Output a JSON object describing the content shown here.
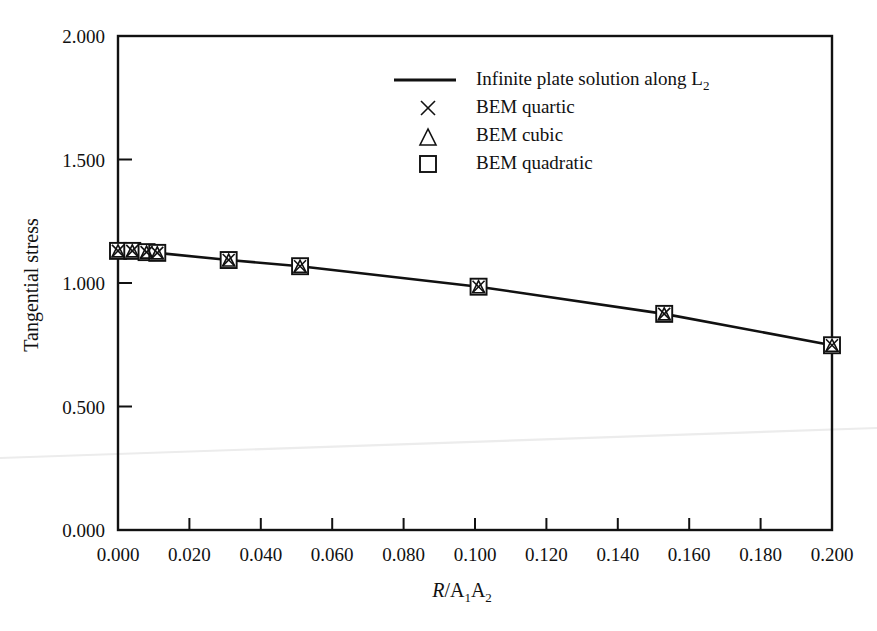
{
  "chart_data": {
    "type": "line",
    "title": "",
    "xlabel": "R/A1A2",
    "xlabel_parts": {
      "italic": "R",
      "slash": "/",
      "a1": "A",
      "sub1": "1",
      "a2": "A",
      "sub2": "2"
    },
    "ylabel": "Tangential stress",
    "xlim": [
      0.0,
      0.2
    ],
    "ylim": [
      0.0,
      2.0
    ],
    "xticks": [
      "0.000",
      "0.020",
      "0.040",
      "0.060",
      "0.080",
      "0.100",
      "0.120",
      "0.140",
      "0.160",
      "0.180",
      "0.200"
    ],
    "xtick_values": [
      0.0,
      0.02,
      0.04,
      0.06,
      0.08,
      0.1,
      0.12,
      0.14,
      0.16,
      0.18,
      0.2
    ],
    "yticks": [
      "0.000",
      "0.500",
      "1.000",
      "1.500",
      "2.000"
    ],
    "ytick_values": [
      0.0,
      0.5,
      1.0,
      1.5,
      2.0
    ],
    "grid": false,
    "legend_position": "top-center",
    "series": [
      {
        "name": "Infinite plate solution along L2",
        "marker": "line",
        "x": [
          0.0,
          0.004,
          0.008,
          0.011,
          0.031,
          0.051,
          0.101,
          0.153,
          0.2
        ],
        "values": [
          1.13,
          1.13,
          1.125,
          1.122,
          1.093,
          1.068,
          0.985,
          0.875,
          0.748
        ]
      },
      {
        "name": "BEM quartic",
        "marker": "cross",
        "x": [
          0.0,
          0.004,
          0.008,
          0.011,
          0.031,
          0.051,
          0.101,
          0.153,
          0.2
        ],
        "values": [
          1.13,
          1.13,
          1.125,
          1.122,
          1.093,
          1.068,
          0.985,
          0.875,
          0.748
        ]
      },
      {
        "name": "BEM cubic",
        "marker": "triangle",
        "x": [
          0.0,
          0.004,
          0.008,
          0.011,
          0.031,
          0.051,
          0.101,
          0.153,
          0.2
        ],
        "values": [
          1.13,
          1.13,
          1.125,
          1.122,
          1.093,
          1.068,
          0.985,
          0.875,
          0.748
        ]
      },
      {
        "name": "BEM quadratic",
        "marker": "square",
        "x": [
          0.0,
          0.004,
          0.008,
          0.011,
          0.031,
          0.051,
          0.101,
          0.153,
          0.2
        ],
        "values": [
          1.13,
          1.13,
          1.125,
          1.122,
          1.093,
          1.068,
          0.985,
          0.875,
          0.748
        ]
      }
    ],
    "legend": [
      {
        "label_prefix": "Infinite plate solution along L",
        "label_sub": "2",
        "marker": "line"
      },
      {
        "label_prefix": "BEM quartic",
        "label_sub": "",
        "marker": "cross"
      },
      {
        "label_prefix": "BEM cubic",
        "label_sub": "",
        "marker": "triangle"
      },
      {
        "label_prefix": "BEM quadratic",
        "label_sub": "",
        "marker": "square"
      }
    ],
    "colors": {
      "ink": "#111111",
      "background": "#ffffff",
      "artifact": "#ececec"
    }
  }
}
